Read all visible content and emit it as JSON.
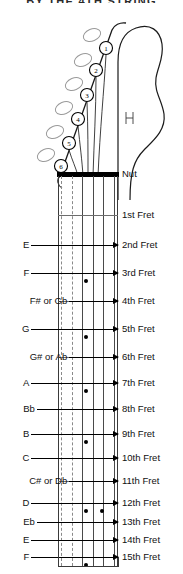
{
  "title": "BY THE 4TH STRING",
  "diagram": {
    "name": "guitar-fretboard-note-chart",
    "nut_label": "Nut",
    "string_count": 6,
    "dashed_strings": [
      1,
      2
    ],
    "tuners": [
      {
        "number": "1",
        "cx": 106,
        "cy": 48
      },
      {
        "number": "2",
        "cx": 96,
        "cy": 70
      },
      {
        "number": "3",
        "cx": 87,
        "cy": 95
      },
      {
        "number": "4",
        "cx": 78,
        "cy": 119
      },
      {
        "number": "5",
        "cx": 69,
        "cy": 143
      },
      {
        "number": "6",
        "cx": 61,
        "cy": 166
      }
    ]
  },
  "frets": [
    {
      "label": "Nut",
      "y": 174,
      "note": "",
      "dot": false
    },
    {
      "label": "1st Fret",
      "y": 215,
      "note": "",
      "dot": false
    },
    {
      "label": "2nd Fret",
      "y": 245,
      "note": "E",
      "dot": false
    },
    {
      "label": "3rd Fret",
      "y": 273,
      "note": "F",
      "dot": true
    },
    {
      "label": "4th Fret",
      "y": 301,
      "note": "F# or Gb",
      "dot": false
    },
    {
      "label": "5th Fret",
      "y": 329,
      "note": "G",
      "dot": true
    },
    {
      "label": "6th Fret",
      "y": 357,
      "note": "G# or Ab",
      "dot": false
    },
    {
      "label": "7th Fret",
      "y": 383,
      "note": "A",
      "dot": true
    },
    {
      "label": "8th Fret",
      "y": 409,
      "note": "Bb",
      "dot": false
    },
    {
      "label": "9th Fret",
      "y": 434,
      "note": "B",
      "dot": true
    },
    {
      "label": "10th Fret",
      "y": 458,
      "note": "C",
      "dot": false
    },
    {
      "label": "11th Fret",
      "y": 481,
      "note": "C# or Db",
      "dot": false
    },
    {
      "label": "12th Fret",
      "y": 503,
      "note": "D",
      "dot": true
    },
    {
      "label": "13th Fret",
      "y": 522,
      "note": "Eb",
      "dot": false
    },
    {
      "label": "14th Fret",
      "y": 540,
      "note": "E",
      "dot": false
    },
    {
      "label": "15th Fret",
      "y": 557,
      "note": "F",
      "dot": true
    }
  ],
  "colors": {
    "ink": "#000000",
    "fret": "#6d6d6d",
    "string": "#4a4a4a",
    "dashed_string": "#8a8a8a"
  }
}
